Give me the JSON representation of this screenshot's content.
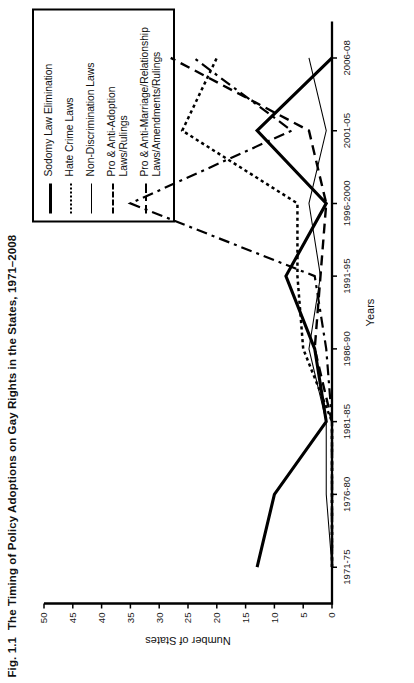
{
  "figure": {
    "number": "Fig. 1.1",
    "title": "The Timing of Policy Adoptions on Gay Rights in the States, 1971–2008"
  },
  "legend": {
    "items": [
      {
        "label": "Sodomy Law Elimination",
        "style": "solid-thick"
      },
      {
        "label": "Hate Crime Laws",
        "style": "dotted"
      },
      {
        "label": "Non-Discrimination Laws",
        "style": "solid-thin"
      },
      {
        "label": "Pro & Anti-Adoption\nLaws/Rulings",
        "style": "dashed"
      },
      {
        "label": "Pro & Anti-Marriage/Relationship\nLaws/Amendments/Rulings",
        "style": "dash-dot"
      }
    ]
  },
  "chart_data": {
    "type": "line",
    "title": "The Timing of Policy Adoptions on Gay Rights in the States, 1971–2008",
    "xlabel": "Years",
    "ylabel": "Number of States",
    "categories": [
      "1971-75",
      "1976-80",
      "1981-85",
      "1986-90",
      "1991-95",
      "1996-2000",
      "2001-05",
      "2006-08"
    ],
    "yticks": [
      0,
      5,
      10,
      15,
      20,
      25,
      30,
      35,
      40,
      45,
      50
    ],
    "ylim": [
      0,
      50
    ],
    "grid": false,
    "legend_position": "top-right-inset-box",
    "series": [
      {
        "name": "Sodomy Law Elimination",
        "style": "solid-thick",
        "values": [
          13,
          10,
          1,
          3,
          8,
          1,
          13,
          0
        ]
      },
      {
        "name": "Hate Crime Laws",
        "style": "dotted",
        "values": [
          0,
          0,
          0,
          5,
          6,
          6,
          26,
          20
        ]
      },
      {
        "name": "Non-Discrimination Laws",
        "style": "solid-thin",
        "values": [
          0,
          1,
          1,
          4,
          2,
          4,
          1,
          4
        ]
      },
      {
        "name": "Pro & Anti-Adoption Laws/Rulings",
        "style": "dashed",
        "values": [
          0,
          0,
          0,
          3,
          2,
          1,
          4,
          28
        ]
      },
      {
        "name": "Pro & Anti-Marriage/Relationship Laws/Amendments/Rulings",
        "style": "dash-dot",
        "values": [
          0,
          0,
          0,
          1,
          3,
          35,
          7,
          24
        ]
      }
    ]
  }
}
